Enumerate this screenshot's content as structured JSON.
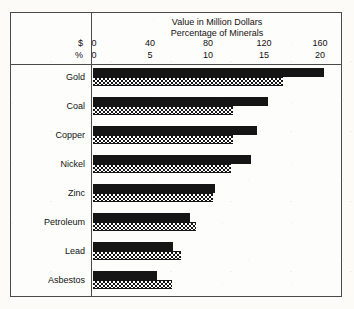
{
  "chart_data": {
    "type": "bar",
    "title": "Value in Million Dollars",
    "subtitle": "Percentage of Minerals",
    "orientation": "horizontal",
    "grouped": true,
    "xlabel": "",
    "ylabel": "",
    "grid": false,
    "legend_position": "none",
    "axes": [
      {
        "name": "dollars",
        "unit_symbol": "$",
        "ticks": [
          0,
          40,
          80,
          120,
          160
        ],
        "tick_labels": [
          "0",
          "40",
          "80",
          "120",
          "160"
        ],
        "range": [
          0,
          160
        ]
      },
      {
        "name": "percentage",
        "unit_symbol": "%",
        "ticks": [
          0,
          5,
          10,
          15,
          20
        ],
        "tick_labels": [
          "0",
          "5",
          "10",
          "15",
          "20"
        ],
        "range": [
          0,
          20
        ]
      }
    ],
    "categories": [
      "Gold",
      "Coal",
      "Copper",
      "Nickel",
      "Zinc",
      "Petroleum",
      "Lead",
      "Asbestos"
    ],
    "series": [
      {
        "name": "Value in Million Dollars",
        "unit": "$",
        "pattern": "solid-black",
        "values": [
          148,
          112,
          105,
          101,
          78,
          62,
          51,
          41
        ]
      },
      {
        "name": "Percentage of Minerals",
        "unit": "%",
        "pattern": "checkerboard",
        "values": [
          15.2,
          11.2,
          11.2,
          11.0,
          9.6,
          8.2,
          7.0,
          6.3
        ]
      }
    ]
  },
  "header": {
    "title": "Value in Million Dollars",
    "subtitle": "Percentage of Minerals",
    "dollar_unit": "$",
    "percent_unit": "%",
    "dollar_ticks": [
      "0",
      "40",
      "80",
      "120",
      "160"
    ],
    "percent_ticks": [
      "0",
      "5",
      "10",
      "15",
      "20"
    ]
  },
  "rows": [
    {
      "label": "Gold",
      "value": 148,
      "percent": 15.2
    },
    {
      "label": "Coal",
      "value": 112,
      "percent": 11.2
    },
    {
      "label": "Copper",
      "value": 105,
      "percent": 11.2
    },
    {
      "label": "Nickel",
      "value": 101,
      "percent": 11.0
    },
    {
      "label": "Zinc",
      "value": 78,
      "percent": 9.6
    },
    {
      "label": "Petroleum",
      "value": 62,
      "percent": 8.2
    },
    {
      "label": "Lead",
      "value": 51,
      "percent": 7.0
    },
    {
      "label": "Asbestos",
      "value": 41,
      "percent": 6.3
    }
  ],
  "colors": {
    "paper": "#fcfbf8",
    "ink": "#151515",
    "frame": "#4a4a4a"
  }
}
